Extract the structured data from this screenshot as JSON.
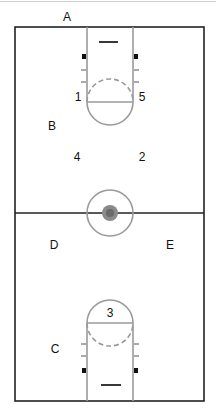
{
  "diagram": {
    "type": "basketball-half-court-set",
    "labels": {
      "A": "A",
      "B": "B",
      "C": "C",
      "D": "D",
      "E": "E",
      "p1": "1",
      "p2": "2",
      "p3": "3",
      "p4": "4",
      "p5": "5"
    },
    "colors": {
      "court_border": "#222222",
      "lane_lines": "#9a9a9a",
      "center_fill": "#777777",
      "blocks": "#111111"
    }
  }
}
